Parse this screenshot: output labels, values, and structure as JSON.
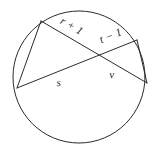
{
  "figure": {
    "type": "geometry-diagram",
    "shape": "circle-with-intersecting-chords",
    "background_color": "#ffffff",
    "stroke_color": "#2b2b2b",
    "label_color": "#1c1c1c",
    "circle": {
      "center_x": 79,
      "center_y": 77,
      "radius": 66
    },
    "points": {
      "top_left": {
        "x": 41,
        "y": 21
      },
      "left": {
        "x": 17,
        "y": 88
      },
      "top_right": {
        "x": 137,
        "y": 40
      },
      "right": {
        "x": 147,
        "y": 83
      },
      "intersection": {
        "x": 96,
        "y": 55
      }
    },
    "segments": [
      {
        "name": "segment-r-plus-1",
        "label": "r + 1",
        "from": "top_left",
        "to": "intersection"
      },
      {
        "name": "segment-t-minus-1",
        "label": "t − 1",
        "from": "top_right",
        "to": "intersection"
      },
      {
        "name": "segment-s",
        "label": "s",
        "from": "left",
        "to": "intersection"
      },
      {
        "name": "segment-v",
        "label": "v",
        "from": "right",
        "to": "intersection"
      }
    ],
    "labels": {
      "r_plus_1": "r + 1",
      "t_minus_1": "t − 1",
      "s": "s",
      "v": "v"
    }
  }
}
